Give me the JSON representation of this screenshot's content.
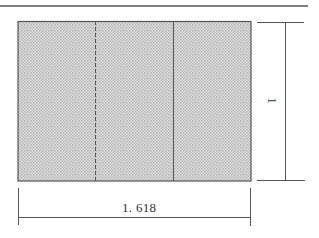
{
  "diagram": {
    "labels": {
      "width": "1. 618",
      "height": "1"
    },
    "colors": {
      "line": "#555555",
      "fill_dot": "#b4b4b4",
      "background": "#ffffff"
    },
    "rectangle": {
      "fill": "dotted-pattern",
      "dividers": [
        {
          "type": "dashed",
          "position": "left"
        },
        {
          "type": "solid",
          "position": "right"
        }
      ]
    }
  }
}
